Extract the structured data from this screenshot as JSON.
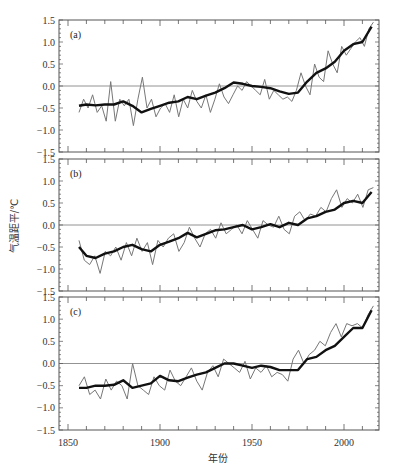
{
  "chart_data": {
    "type": "line",
    "title": "",
    "xlabel": "年份",
    "ylabel": "气温距平/℃",
    "xlim": [
      1845,
      2019
    ],
    "ylim": [
      -1.5,
      1.5
    ],
    "x_ticks": [
      1850,
      1900,
      1950,
      2000
    ],
    "y_ticks": [
      -1.5,
      -1.0,
      -0.5,
      0.0,
      0.5,
      1.0,
      1.5
    ],
    "y_tick_labels": [
      "-1.5",
      "-1.0",
      "-0.5",
      "0.0",
      "0.5",
      "1.0",
      "1.5"
    ],
    "grid": false,
    "zero_line": true,
    "legend": null,
    "panels": [
      {
        "label": "(a)",
        "smooth_x": [
          1856,
          1860,
          1865,
          1870,
          1875,
          1880,
          1885,
          1890,
          1895,
          1900,
          1905,
          1910,
          1915,
          1920,
          1925,
          1930,
          1935,
          1940,
          1945,
          1950,
          1955,
          1960,
          1965,
          1970,
          1975,
          1980,
          1985,
          1990,
          1995,
          2000,
          2005,
          2010,
          2015
        ],
        "smooth": [
          -0.45,
          -0.42,
          -0.44,
          -0.42,
          -0.42,
          -0.35,
          -0.45,
          -0.6,
          -0.52,
          -0.45,
          -0.38,
          -0.35,
          -0.25,
          -0.3,
          -0.22,
          -0.15,
          -0.05,
          0.08,
          0.05,
          0.0,
          -0.02,
          -0.05,
          -0.12,
          -0.18,
          -0.15,
          0.1,
          0.3,
          0.4,
          0.55,
          0.8,
          0.95,
          1.0,
          1.35
        ],
        "annual": [
          -0.6,
          -0.3,
          -0.5,
          -0.2,
          -0.6,
          -0.45,
          -0.8,
          0.1,
          -0.8,
          -0.3,
          -0.45,
          -0.3,
          -0.9,
          -0.3,
          0.2,
          -0.5,
          -0.3,
          -0.7,
          -0.5,
          -0.4,
          -0.6,
          -0.2,
          -0.7,
          -0.3,
          -0.5,
          -0.1,
          -0.35,
          -0.5,
          -0.2,
          -0.6,
          -0.3,
          0.05,
          -0.25,
          -0.4,
          -0.2,
          0.0,
          -0.1,
          0.1,
          0.0,
          -0.1,
          -0.2,
          0.15,
          -0.3,
          -0.1,
          -0.2,
          -0.3,
          -0.25,
          -0.35,
          -0.1,
          0.3,
          0.0,
          -0.2,
          0.5,
          0.2,
          0.1,
          0.8,
          0.5,
          0.3,
          0.9,
          0.7,
          0.85,
          1.0,
          1.1,
          0.9,
          1.3,
          1.45
        ]
      },
      {
        "label": "(b)",
        "smooth_x": [
          1856,
          1860,
          1865,
          1870,
          1875,
          1880,
          1885,
          1890,
          1895,
          1900,
          1905,
          1910,
          1915,
          1920,
          1925,
          1930,
          1935,
          1940,
          1945,
          1950,
          1955,
          1960,
          1965,
          1970,
          1975,
          1980,
          1985,
          1990,
          1995,
          2000,
          2005,
          2010,
          2015
        ],
        "smooth": [
          -0.5,
          -0.7,
          -0.75,
          -0.65,
          -0.6,
          -0.5,
          -0.45,
          -0.55,
          -0.6,
          -0.45,
          -0.38,
          -0.3,
          -0.18,
          -0.28,
          -0.2,
          -0.12,
          -0.1,
          -0.05,
          0.0,
          -0.1,
          -0.05,
          0.02,
          -0.05,
          0.05,
          0.0,
          0.15,
          0.2,
          0.3,
          0.35,
          0.5,
          0.55,
          0.5,
          0.75
        ],
        "annual": [
          -0.35,
          -0.8,
          -0.9,
          -0.7,
          -1.1,
          -0.6,
          -0.7,
          -0.5,
          -0.8,
          -0.4,
          -0.7,
          -0.3,
          -0.6,
          -0.4,
          -0.9,
          -0.35,
          -0.5,
          -0.3,
          -0.2,
          -0.6,
          -0.4,
          -0.05,
          -0.3,
          -0.5,
          -0.2,
          -0.1,
          -0.3,
          0.05,
          -0.2,
          -0.1,
          0.0,
          -0.2,
          0.1,
          -0.1,
          -0.3,
          0.1,
          0.0,
          -0.05,
          0.2,
          -0.1,
          -0.2,
          0.2,
          0.3,
          0.1,
          0.25,
          0.2,
          0.4,
          0.3,
          0.6,
          0.8,
          0.4,
          0.6,
          0.5,
          0.7,
          0.4,
          0.8,
          0.85
        ]
      },
      {
        "label": "(c)",
        "smooth_x": [
          1856,
          1860,
          1865,
          1870,
          1875,
          1880,
          1885,
          1890,
          1895,
          1900,
          1905,
          1910,
          1915,
          1920,
          1925,
          1930,
          1935,
          1940,
          1945,
          1950,
          1955,
          1960,
          1965,
          1970,
          1975,
          1980,
          1985,
          1990,
          1995,
          2000,
          2005,
          2010,
          2015
        ],
        "smooth": [
          -0.55,
          -0.55,
          -0.5,
          -0.5,
          -0.48,
          -0.38,
          -0.55,
          -0.5,
          -0.45,
          -0.28,
          -0.38,
          -0.4,
          -0.32,
          -0.25,
          -0.2,
          -0.1,
          0.0,
          0.0,
          -0.05,
          -0.1,
          -0.05,
          -0.08,
          -0.15,
          -0.15,
          -0.15,
          0.1,
          0.15,
          0.3,
          0.4,
          0.6,
          0.8,
          0.8,
          1.2
        ],
        "annual": [
          -0.5,
          -0.3,
          -0.7,
          -0.6,
          -0.8,
          -0.35,
          -0.6,
          -0.4,
          -0.5,
          -0.8,
          0.0,
          -0.5,
          -0.6,
          -0.7,
          -0.3,
          -0.5,
          -0.6,
          -0.15,
          -0.4,
          -0.5,
          -0.3,
          -0.1,
          -0.4,
          -0.6,
          -0.2,
          -0.05,
          -0.3,
          0.1,
          0.0,
          -0.1,
          -0.2,
          0.05,
          -0.35,
          -0.1,
          -0.2,
          -0.05,
          -0.3,
          -0.2,
          -0.25,
          -0.4,
          0.1,
          0.3,
          0.0,
          0.2,
          0.3,
          0.5,
          0.4,
          0.7,
          0.9,
          0.6,
          0.9,
          0.85,
          0.9,
          0.8,
          1.1,
          1.3
        ]
      }
    ]
  }
}
